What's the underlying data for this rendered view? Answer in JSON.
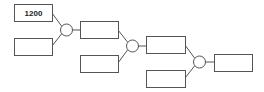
{
  "diagram": {
    "type": "tree-combination",
    "boxes": [
      {
        "id": "A",
        "label": "1200"
      },
      {
        "id": "B",
        "label": ""
      },
      {
        "id": "C",
        "label": ""
      },
      {
        "id": "D",
        "label": ""
      },
      {
        "id": "E",
        "label": ""
      },
      {
        "id": "F",
        "label": ""
      },
      {
        "id": "G",
        "label": ""
      }
    ],
    "operators": [
      {
        "id": "op1",
        "inputs": [
          "A",
          "B"
        ],
        "output": "C",
        "symbol": ""
      },
      {
        "id": "op2",
        "inputs": [
          "C",
          "D"
        ],
        "output": "E",
        "symbol": ""
      },
      {
        "id": "op3",
        "inputs": [
          "E",
          "F"
        ],
        "output": "G",
        "symbol": ""
      }
    ]
  }
}
